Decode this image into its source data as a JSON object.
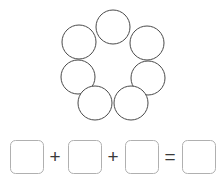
{
  "page": {
    "background_color": "#ffffff",
    "width": 224,
    "height": 180
  },
  "style": {
    "circle_stroke_color": "#4a4a4a",
    "circle_fill_color": "#ffffff",
    "circle_stroke_width": 1,
    "box_stroke_color": "#b0b0b0",
    "box_fill_color": "#ffffff",
    "box_stroke_width": 1,
    "box_corner_radius": 5,
    "operator_color": "#3a3a3a"
  },
  "figure": {
    "name": "circle-ring",
    "shape": "circle",
    "count": 7,
    "arrangement": "ring",
    "rows": [
      {
        "label": "top-row",
        "count": 3
      },
      {
        "label": "middle-row",
        "count": 2
      },
      {
        "label": "bottom-row",
        "count": 2
      }
    ],
    "circles": [
      {
        "id": "circle-top-center",
        "cx": 113,
        "cy": 27,
        "r": 17
      },
      {
        "id": "circle-upper-left",
        "cx": 79,
        "cy": 42,
        "r": 17
      },
      {
        "id": "circle-upper-right",
        "cx": 147,
        "cy": 43,
        "r": 17
      },
      {
        "id": "circle-middle-left",
        "cx": 78,
        "cy": 77,
        "r": 17
      },
      {
        "id": "circle-middle-right",
        "cx": 148,
        "cy": 78,
        "r": 17
      },
      {
        "id": "circle-bottom-left",
        "cx": 95,
        "cy": 103,
        "r": 17
      },
      {
        "id": "circle-bottom-right",
        "cx": 131,
        "cy": 103,
        "r": 17
      }
    ]
  },
  "equation": {
    "name": "addition-equation",
    "expression": "□ + □ + □ = □",
    "answer_boxes": [
      {
        "id": "addend-box-1",
        "value": "",
        "x": 10,
        "y": 140,
        "w": 33,
        "h": 33
      },
      {
        "id": "addend-box-2",
        "value": "",
        "x": 68,
        "y": 140,
        "w": 33,
        "h": 33
      },
      {
        "id": "addend-box-3",
        "value": "",
        "x": 125,
        "y": 140,
        "w": 33,
        "h": 33
      },
      {
        "id": "sum-box",
        "value": "",
        "x": 182,
        "y": 140,
        "w": 33,
        "h": 33
      }
    ],
    "operators": [
      {
        "id": "plus-1",
        "symbol": "+",
        "x": 55,
        "y": 157
      },
      {
        "id": "plus-2",
        "symbol": "+",
        "x": 113,
        "y": 157
      },
      {
        "id": "equals-1",
        "symbol": "=",
        "x": 170,
        "y": 157
      }
    ]
  }
}
